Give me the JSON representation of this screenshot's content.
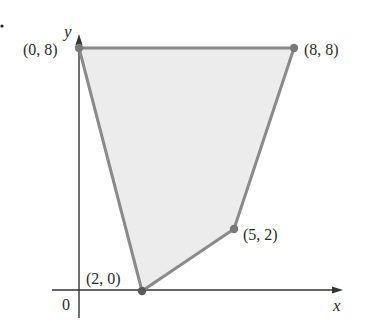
{
  "diagram": {
    "type": "feasible-region",
    "axes": {
      "x_label": "x",
      "y_label": "y",
      "origin_label": "0"
    },
    "vertices": [
      {
        "label": "(0, 8)",
        "x": 0,
        "y": 8
      },
      {
        "label": "(8, 8)",
        "x": 8,
        "y": 8
      },
      {
        "label": "(5, 2)",
        "x": 5,
        "y": 2
      },
      {
        "label": "(2, 0)",
        "x": 2,
        "y": 0
      }
    ],
    "colors": {
      "region_fill": "#ececec",
      "region_edge": "#8a8a8a",
      "vertex_dot": "#7a7a7a",
      "axis": "#333333",
      "text": "#2a2a2a"
    }
  }
}
